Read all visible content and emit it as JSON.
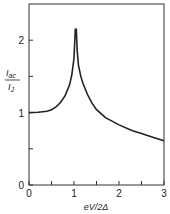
{
  "chart_data": {
    "type": "line",
    "title": "",
    "xlabel": "eV/2Δ",
    "ylabel_num": "I",
    "ylabel_num_sub": "ac",
    "ylabel_den": "I",
    "ylabel_den_sub": "J",
    "xlim": [
      0,
      3
    ],
    "ylim": [
      0,
      2.5
    ],
    "x_ticks": [
      {
        "value": 0,
        "label": "0"
      },
      {
        "value": 0.5,
        "label": ""
      },
      {
        "value": 1,
        "label": "1"
      },
      {
        "value": 1.5,
        "label": ""
      },
      {
        "value": 2,
        "label": "2"
      },
      {
        "value": 2.5,
        "label": ""
      },
      {
        "value": 3,
        "label": "3"
      }
    ],
    "y_ticks": [
      {
        "value": 0,
        "label": "0"
      },
      {
        "value": 0.5,
        "label": ""
      },
      {
        "value": 1,
        "label": "1"
      },
      {
        "value": 1.5,
        "label": ""
      },
      {
        "value": 2,
        "label": "2"
      }
    ],
    "grid": false,
    "series": [
      {
        "name": "Iac/IJ",
        "x": [
          0,
          0.2,
          0.4,
          0.5,
          0.6,
          0.7,
          0.8,
          0.9,
          0.95,
          1.0,
          1.03,
          1.05,
          1.07,
          1.1,
          1.15,
          1.2,
          1.3,
          1.4,
          1.5,
          1.7,
          2.0,
          2.3,
          2.5,
          2.8,
          3.0
        ],
        "y": [
          1.0,
          1.005,
          1.02,
          1.04,
          1.08,
          1.14,
          1.23,
          1.38,
          1.52,
          1.75,
          2.15,
          2.15,
          1.85,
          1.65,
          1.5,
          1.4,
          1.25,
          1.13,
          1.04,
          0.93,
          0.83,
          0.75,
          0.71,
          0.65,
          0.61
        ]
      }
    ]
  }
}
